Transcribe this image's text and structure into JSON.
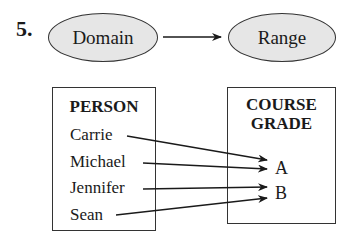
{
  "problem": {
    "number": "5."
  },
  "header_diagram": {
    "domain_label": "Domain",
    "range_label": "Range",
    "arrow": "domain-to-range"
  },
  "domain_set": {
    "title": "PERSON",
    "items": [
      "Carrie",
      "Michael",
      "Jennifer",
      "Sean"
    ]
  },
  "range_set": {
    "title_line1": "COURSE",
    "title_line2": "GRADE",
    "items": [
      "A",
      "B"
    ]
  },
  "mappings": [
    {
      "from": "Carrie",
      "to": "A"
    },
    {
      "from": "Michael",
      "to": "A"
    },
    {
      "from": "Jennifer",
      "to": "B"
    },
    {
      "from": "Sean",
      "to": "B"
    }
  ],
  "colors": {
    "ellipse_fill": "#e6e6e6",
    "stroke": "#333333",
    "text": "#1a1a1a",
    "background": "#ffffff"
  }
}
